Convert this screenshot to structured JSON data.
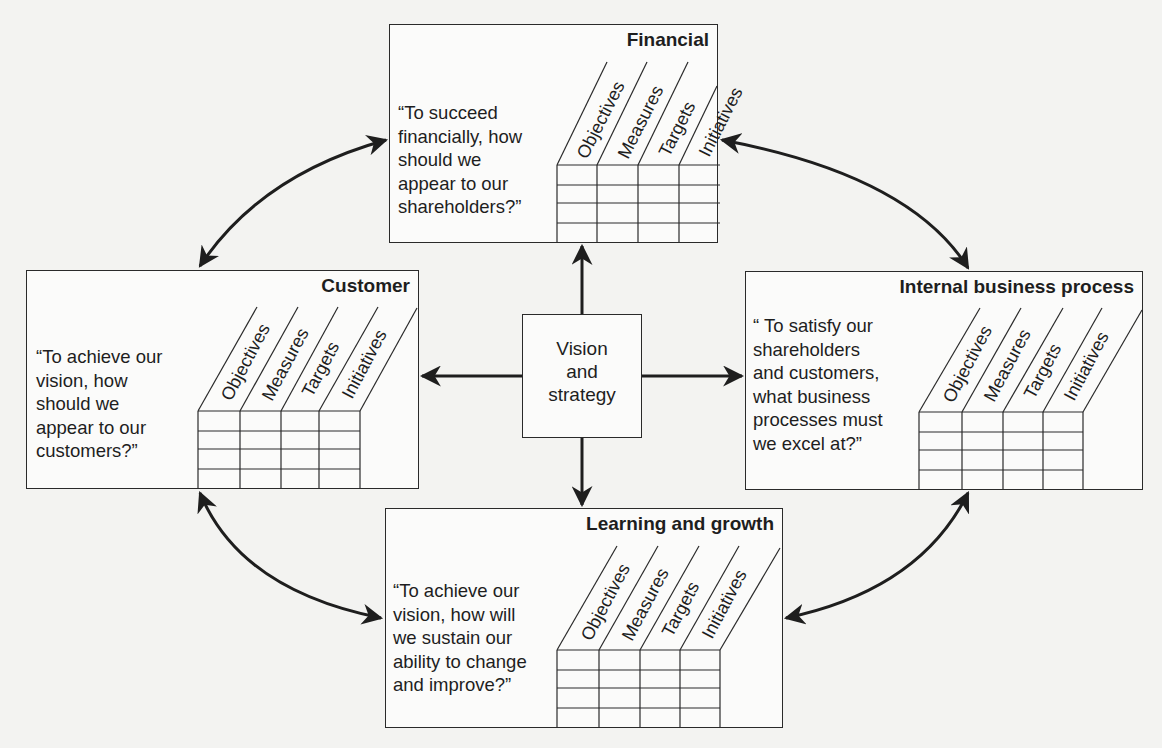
{
  "diagram": {
    "type": "balanced-scorecard",
    "center": {
      "label": "Vision\nand\nstrategy"
    },
    "column_headers": [
      "Objectives",
      "Measures",
      "Targets",
      "Initiatives"
    ],
    "perspectives": {
      "financial": {
        "title": "Financial",
        "question": "“To succeed\nfinancially, how\nshould we\nappear to our\nshareholders?”"
      },
      "customer": {
        "title": "Customer",
        "question": "“To achieve our\nvision, how\nshould we\nappear to our\ncustomers?”"
      },
      "internal": {
        "title": "Internal business process",
        "question": "“ To satisfy our\nshareholders\nand customers,\nwhat business\nprocesses must\nwe excel at?”"
      },
      "learning": {
        "title": "Learning and growth",
        "question": "“To achieve our\nvision, how will\nwe sustain our\nability to change\nand improve?”"
      }
    },
    "connections": [
      {
        "from": "Vision and strategy",
        "to": "Financial",
        "type": "arrow"
      },
      {
        "from": "Vision and strategy",
        "to": "Customer",
        "type": "arrow"
      },
      {
        "from": "Vision and strategy",
        "to": "Internal business process",
        "type": "arrow"
      },
      {
        "from": "Vision and strategy",
        "to": "Learning and growth",
        "type": "arrow"
      },
      {
        "from": "Financial",
        "to": "Customer",
        "type": "double-arrow-curved"
      },
      {
        "from": "Financial",
        "to": "Internal business process",
        "type": "double-arrow-curved"
      },
      {
        "from": "Customer",
        "to": "Learning and growth",
        "type": "double-arrow-curved"
      },
      {
        "from": "Internal business process",
        "to": "Learning and growth",
        "type": "double-arrow-curved"
      }
    ]
  }
}
